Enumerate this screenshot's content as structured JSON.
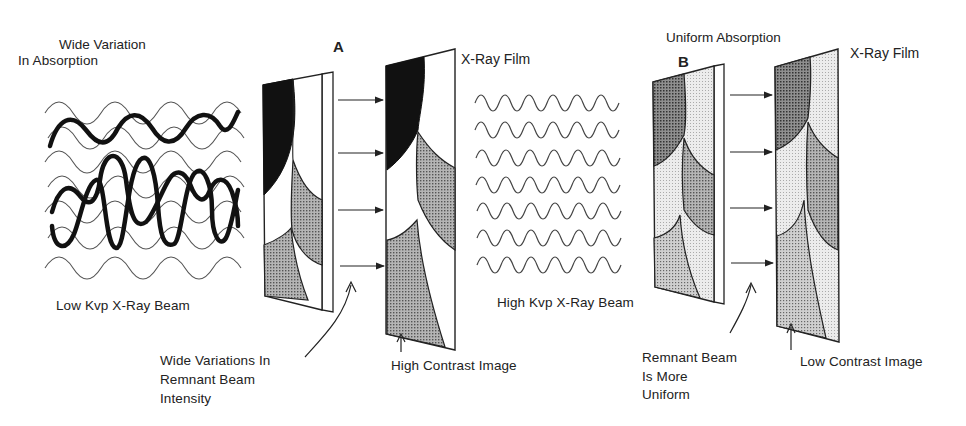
{
  "diagram": {
    "colors": {
      "background": "#ffffff",
      "ink": "#1a1a1a",
      "black_region": "#111111",
      "dark_gray_region": "#8a8a8a",
      "medium_gray_region": "#a8a8a8",
      "light_gray_region": "#d9d9d9",
      "white_region": "#ffffff"
    },
    "panel_a": {
      "label": "A",
      "absorption_label_line1": "Wide Variation",
      "absorption_label_line2": "In Absorption",
      "beam_label": "Low Kvp X-Ray Beam",
      "film_label": "X-Ray Film",
      "remnant_label_line1": "Wide Variations In",
      "remnant_label_line2": "Remnant Beam",
      "remnant_label_line3": "Intensity",
      "image_label": "High Contrast Image",
      "arrow_count": 4
    },
    "panel_b": {
      "label": "B",
      "absorption_label": "Uniform Absorption",
      "beam_label": "High Kvp X-Ray Beam",
      "film_label": "X-Ray Film",
      "remnant_label_line1": "Remnant Beam",
      "remnant_label_line2": "Is More",
      "remnant_label_line3": "Uniform",
      "image_label": "Low Contrast Image",
      "arrow_count": 4
    }
  }
}
